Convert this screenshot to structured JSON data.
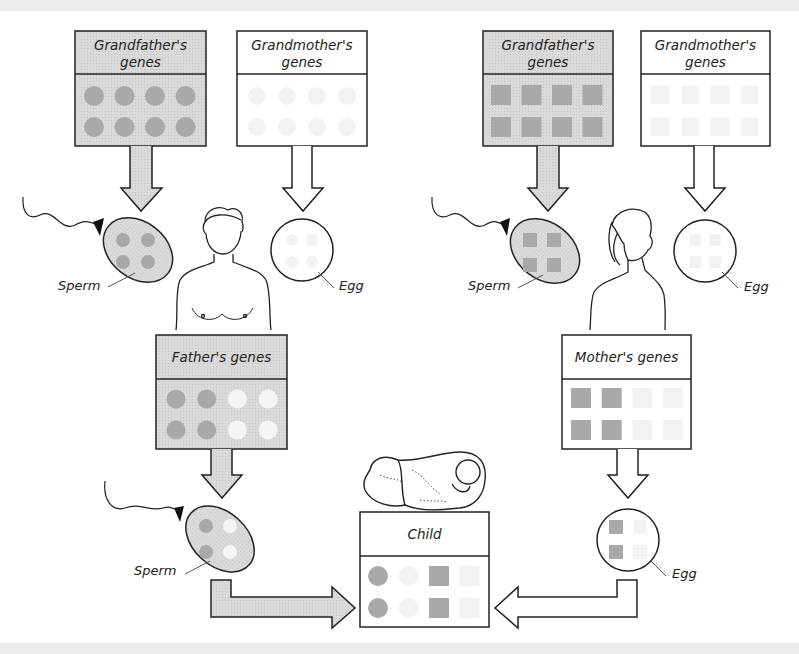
{
  "colors": {
    "gray_fill": "#d4d4d4",
    "gene_dark": "#a9a9a9",
    "gene_white": "#f4f4f4",
    "gene_ghost": "#f2f2f2",
    "stroke": "#222222",
    "band": "#ebebeb"
  },
  "left_lineage": {
    "grandfather": {
      "title_line1": "Grandfather's",
      "title_line2": "genes",
      "shape": "circle",
      "genes": [
        "dark",
        "dark",
        "dark",
        "dark",
        "dark",
        "dark",
        "dark",
        "dark"
      ]
    },
    "grandmother": {
      "title_line1": "Grandmother's",
      "title_line2": "genes",
      "shape": "circle",
      "genes": [
        "ghost",
        "ghost",
        "ghost",
        "ghost",
        "ghost",
        "ghost",
        "ghost",
        "ghost"
      ]
    },
    "sperm_label": "Sperm",
    "sperm_genes": [
      "dark",
      "dark",
      "dark",
      "dark"
    ],
    "egg_label": "Egg",
    "egg_genes": [
      "ghost",
      "ghost",
      "ghost",
      "ghost"
    ],
    "parent_figure": "father",
    "parent": {
      "title": "Father's genes",
      "genes": [
        "dark",
        "dark",
        "white",
        "white",
        "dark",
        "dark",
        "white",
        "white"
      ]
    },
    "gamete_label": "Sperm",
    "gamete_genes": [
      "dark",
      "white",
      "dark",
      "white"
    ]
  },
  "right_lineage": {
    "grandfather": {
      "title_line1": "Grandfather's",
      "title_line2": "genes",
      "shape": "square",
      "genes": [
        "dark",
        "dark",
        "dark",
        "dark",
        "dark",
        "dark",
        "dark",
        "dark"
      ]
    },
    "grandmother": {
      "title_line1": "Grandmother's",
      "title_line2": "genes",
      "shape": "square",
      "genes": [
        "ghost",
        "ghost",
        "ghost",
        "ghost",
        "ghost",
        "ghost",
        "ghost",
        "ghost"
      ]
    },
    "sperm_label": "Sperm",
    "sperm_genes": [
      "dark",
      "dark",
      "dark",
      "dark"
    ],
    "egg_label": "Egg",
    "egg_genes": [
      "ghost",
      "ghost",
      "ghost",
      "ghost"
    ],
    "parent_figure": "mother",
    "parent": {
      "title": "Mother's genes",
      "genes": [
        "dark",
        "dark",
        "ghost",
        "ghost",
        "dark",
        "dark",
        "ghost",
        "ghost"
      ]
    },
    "gamete_label": "Egg",
    "gamete_genes": [
      "dark",
      "ghost",
      "dark",
      "ghost"
    ]
  },
  "child": {
    "title": "Child",
    "genes": [
      {
        "shape": "circle",
        "tone": "dark"
      },
      {
        "shape": "circle",
        "tone": "ghost"
      },
      {
        "shape": "square",
        "tone": "dark"
      },
      {
        "shape": "square",
        "tone": "ghost"
      },
      {
        "shape": "circle",
        "tone": "dark"
      },
      {
        "shape": "circle",
        "tone": "ghost"
      },
      {
        "shape": "square",
        "tone": "dark"
      },
      {
        "shape": "square",
        "tone": "ghost"
      }
    ]
  }
}
